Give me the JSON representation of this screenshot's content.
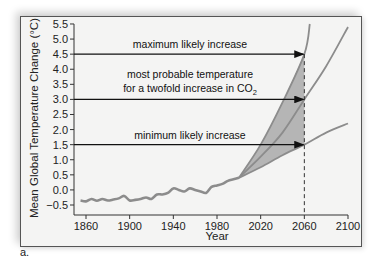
{
  "chart_data": {
    "type": "line",
    "title": "",
    "xlabel": "Year",
    "ylabel": "Mean Global Temperature Change (°C)",
    "xlim": [
      1850,
      2100
    ],
    "ylim": [
      -0.5,
      5.5
    ],
    "x_ticks": [
      1860,
      1900,
      1940,
      1980,
      2020,
      2060,
      2100
    ],
    "y_ticks": [
      "5.5",
      "5.0",
      "4.5",
      "4.0",
      "3.5",
      "3.0",
      "2.5",
      "2.0",
      "1.5",
      "1.0",
      "0.5",
      "0.0",
      "-0.5"
    ],
    "grid": false,
    "series": [
      {
        "name": "observed temperature change",
        "x": [
          1855,
          1860,
          1865,
          1870,
          1875,
          1880,
          1885,
          1890,
          1895,
          1900,
          1905,
          1910,
          1915,
          1920,
          1925,
          1930,
          1935,
          1940,
          1945,
          1950,
          1955,
          1960,
          1965,
          1970,
          1975,
          1980,
          1985,
          1990,
          1995,
          2000
        ],
        "values": [
          -0.35,
          -0.38,
          -0.3,
          -0.36,
          -0.3,
          -0.35,
          -0.32,
          -0.28,
          -0.2,
          -0.35,
          -0.33,
          -0.3,
          -0.25,
          -0.3,
          -0.15,
          -0.15,
          -0.1,
          0.05,
          0.0,
          -0.05,
          0.05,
          0.0,
          -0.05,
          -0.1,
          0.1,
          0.15,
          0.2,
          0.3,
          0.35,
          0.4
        ]
      },
      {
        "name": "maximum likely increase",
        "x": [
          2000,
          2020,
          2040,
          2060,
          2065
        ],
        "values": [
          0.4,
          1.5,
          2.9,
          4.5,
          5.5
        ]
      },
      {
        "name": "most probable temperature for a twofold increase in CO2",
        "x": [
          2000,
          2020,
          2040,
          2060,
          2080,
          2100
        ],
        "values": [
          0.4,
          1.1,
          1.9,
          3.0,
          4.1,
          5.4
        ]
      },
      {
        "name": "minimum likely increase",
        "x": [
          2000,
          2020,
          2040,
          2060,
          2080,
          2100
        ],
        "values": [
          0.4,
          0.75,
          1.15,
          1.5,
          1.9,
          2.2
        ]
      }
    ],
    "annotations": [
      {
        "text": "maximum likely increase",
        "value": 4.5,
        "arrow_to_year": 2060
      },
      {
        "text": "most probable temperature",
        "text2": "for a twofold increase in CO",
        "subscript": "2",
        "value": 3.0,
        "arrow_to_year": 2060
      },
      {
        "text": "minimum likely increase",
        "value": 1.5,
        "arrow_to_year": 2060
      }
    ],
    "reference_line": {
      "year": 2060,
      "style": "dashed"
    },
    "shaded_region": "between maximum and minimum likely increase, 2000–2060",
    "legend": "none"
  },
  "panel_label": "a."
}
